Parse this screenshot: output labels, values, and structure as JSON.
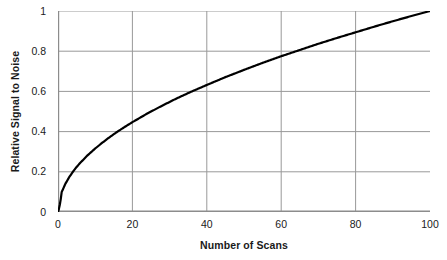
{
  "chart_data": {
    "type": "line",
    "title": "",
    "xlabel": "Number of Scans",
    "ylabel": "Relative Signal to Noise",
    "xlim": [
      0,
      100
    ],
    "ylim": [
      0,
      1
    ],
    "xticks": [
      "0",
      "20",
      "40",
      "60",
      "80",
      "100"
    ],
    "xtick_values": [
      0,
      20,
      40,
      60,
      80,
      100
    ],
    "yticks": [
      "0",
      "0.2",
      "0.4",
      "0.6",
      "0.8",
      "1"
    ],
    "ytick_values": [
      0,
      0.2,
      0.4,
      0.6,
      0.8,
      1
    ],
    "grid": true,
    "grid_color": "#999999",
    "legend": null,
    "line_color": "#000000",
    "line_width": 2.2,
    "series": [
      {
        "name": "Relative Signal to Noise",
        "relationship": "y = sqrt(x/100)",
        "x": [
          0,
          1,
          2,
          3,
          4,
          5,
          6,
          8,
          10,
          12,
          14,
          16,
          18,
          20,
          24,
          28,
          32,
          36,
          40,
          45,
          50,
          55,
          60,
          65,
          70,
          75,
          80,
          85,
          90,
          95,
          100
        ],
        "values": [
          0,
          0.1,
          0.141,
          0.173,
          0.2,
          0.224,
          0.245,
          0.283,
          0.316,
          0.346,
          0.374,
          0.4,
          0.424,
          0.447,
          0.49,
          0.529,
          0.566,
          0.6,
          0.632,
          0.671,
          0.707,
          0.742,
          0.775,
          0.806,
          0.837,
          0.866,
          0.894,
          0.922,
          0.949,
          0.975,
          1.0
        ]
      }
    ]
  },
  "axes": {
    "y_title": "Relative Signal to Noise",
    "x_title": "Number of Scans"
  }
}
